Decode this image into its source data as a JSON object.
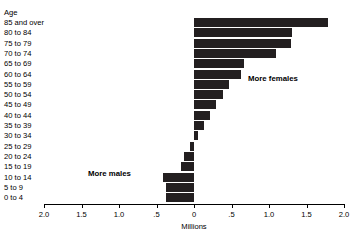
{
  "axis_title_y": "Age",
  "axis_title_x": "Millions",
  "annotations": {
    "more_females": "More females",
    "more_males": "More males"
  },
  "x_ticks": [
    {
      "label": "2.0",
      "value": -2.0
    },
    {
      "label": "1.5",
      "value": -1.5
    },
    {
      "label": "1.0",
      "value": -1.0
    },
    {
      "label": ".5",
      "value": -0.5
    },
    {
      "label": "0",
      "value": 0.0
    },
    {
      "label": ".5",
      "value": 0.5
    },
    {
      "label": "1.0",
      "value": 1.0
    },
    {
      "label": "1.5",
      "value": 1.5
    },
    {
      "label": "2.0",
      "value": 2.0
    }
  ],
  "chart_data": {
    "type": "bar",
    "orientation": "horizontal",
    "title": "",
    "subtitle": "",
    "xlabel": "Millions",
    "ylabel": "Age",
    "xlim": [
      -2.0,
      2.0
    ],
    "grid": false,
    "legend": null,
    "bar_color": "#231f20",
    "note": "Diverging horizontal bar chart (excess of females to the right of zero, excess of males to the left of zero), in millions of persons.",
    "categories": [
      "85 and over",
      "80 to 84",
      "75 to 79",
      "70 to 74",
      "65 to 69",
      "60 to 64",
      "55 to 59",
      "50 to 54",
      "45 to 49",
      "40 to 44",
      "35 to 39",
      "30 to 34",
      "25 to 29",
      "20 to 24",
      "15 to 19",
      "10 to 14",
      "5 to 9",
      "0 to 4"
    ],
    "values": [
      1.78,
      1.3,
      1.29,
      1.09,
      0.66,
      0.62,
      0.46,
      0.38,
      0.29,
      0.21,
      0.13,
      0.05,
      -0.05,
      -0.13,
      -0.17,
      -0.41,
      -0.37,
      -0.38
    ],
    "annotations": [
      {
        "text": "More females",
        "x": 0.72,
        "y": "60 to 64"
      },
      {
        "text": "More males",
        "x": -1.41,
        "y": "15 to 19"
      }
    ]
  }
}
